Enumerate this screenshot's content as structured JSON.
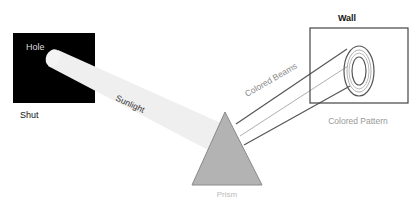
{
  "diagram": {
    "labels": {
      "hole": "Hole",
      "shut": "Shut",
      "sunlight": "Sunlight",
      "prism": "Prism",
      "colored_beams": "Colored Beams",
      "wall": "Wall",
      "colored_pattern": "Colored Pattern"
    },
    "colors": {
      "shutter": "#000000",
      "beam": "#efefef",
      "prism_fill": "#b3b3b3",
      "prism_stroke": "#8a8a8a",
      "lines": "#555555",
      "faint_text": "#aaaaaa"
    }
  }
}
